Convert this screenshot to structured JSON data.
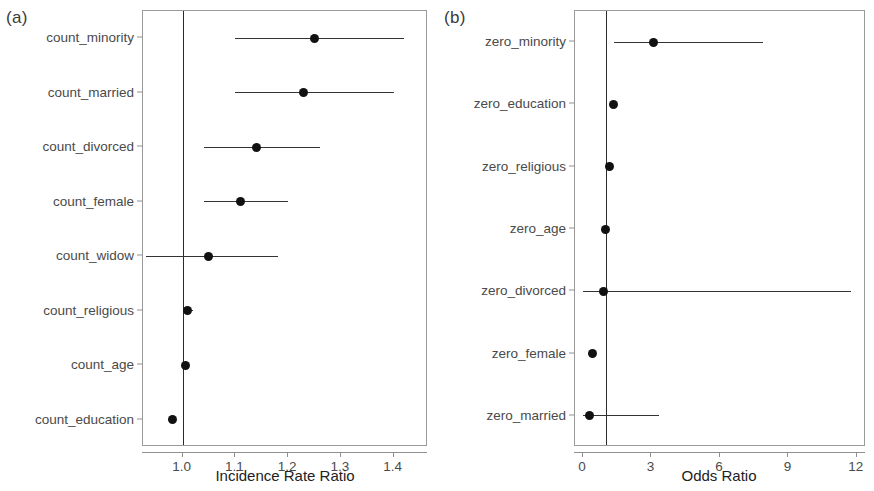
{
  "figure": {
    "background": "#ffffff",
    "point_color": "#111111",
    "line_color": "#333333",
    "axis_color": "#8f8f8f",
    "label_color": "#4a4a4a"
  },
  "panels": [
    {
      "tag": "(a)",
      "xlabel": "Incidence Rate Ratio",
      "null_value": "1.0"
    },
    {
      "tag": "(b)",
      "xlabel": "Odds Ratio",
      "null_value": "1"
    }
  ],
  "chart_data": [
    {
      "type": "scatter",
      "subtype": "forest-plot",
      "panel": "(a)",
      "title": "",
      "xlabel": "Incidence Rate Ratio",
      "ylabel": "",
      "xlim": [
        0.925,
        1.465
      ],
      "xticks": [
        1.0,
        1.1,
        1.2,
        1.3,
        1.4
      ],
      "xticklabels": [
        "1.0",
        "1.1",
        "1.2",
        "1.3",
        "1.4"
      ],
      "reference_line": 1.0,
      "grid": false,
      "legend": "none",
      "categories": [
        "count_minority",
        "count_married",
        "count_divorced",
        "count_female",
        "count_widow",
        "count_religious",
        "count_age",
        "count_education"
      ],
      "estimates": [
        1.25,
        1.23,
        1.14,
        1.11,
        1.05,
        1.01,
        1.005,
        0.98
      ],
      "ci_low": [
        1.1,
        1.1,
        1.04,
        1.04,
        0.93,
        1.0,
        1.0,
        0.975
      ],
      "ci_high": [
        1.42,
        1.4,
        1.26,
        1.2,
        1.18,
        1.02,
        1.01,
        0.985
      ]
    },
    {
      "type": "scatter",
      "subtype": "forest-plot",
      "panel": "(b)",
      "title": "",
      "xlabel": "Odds Ratio",
      "ylabel": "",
      "xlim": [
        -0.35,
        12.4
      ],
      "xticks": [
        0,
        3,
        6,
        9,
        12
      ],
      "xticklabels": [
        "0",
        "3",
        "6",
        "9",
        "12"
      ],
      "reference_line": 1.0,
      "grid": false,
      "legend": "none",
      "categories": [
        "zero_minority",
        "zero_education",
        "zero_religious",
        "zero_age",
        "zero_divorced",
        "zero_female",
        "zero_married"
      ],
      "estimates": [
        3.1,
        1.35,
        1.15,
        0.98,
        0.92,
        0.4,
        0.3
      ],
      "ci_low": [
        1.35,
        1.2,
        1.05,
        0.88,
        0.02,
        0.28,
        0.02
      ],
      "ci_high": [
        7.9,
        1.5,
        1.25,
        1.08,
        11.75,
        0.52,
        3.35
      ]
    }
  ]
}
